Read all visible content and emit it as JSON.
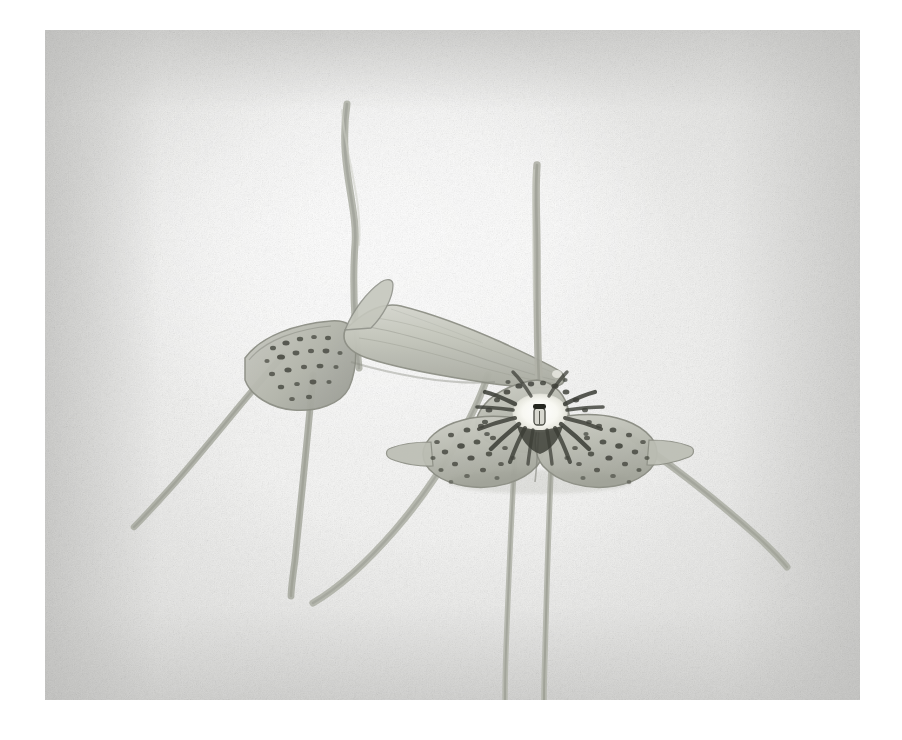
{
  "artwork": {
    "title": "Two Masdevallia Orchid Flowers",
    "medium": "Watercolor and graphite on textured paper",
    "subject": "orchid",
    "orientation": "landscape",
    "canvas": {
      "width": 902,
      "height": 740
    },
    "plate": {
      "left": 45,
      "top": 30,
      "width": 815,
      "height": 670
    },
    "background": {
      "paper_color": "#f7f7f6",
      "vignette_color": "#c8c8c6",
      "highlight_color": "#ffffff",
      "texture": "graphite-tooth"
    },
    "palette": {
      "sepal_light": "#c9cac2",
      "sepal_mid": "#b0b2a8",
      "sepal_shadow": "#9a9c92",
      "outline": "#8b8d83",
      "tail_stroke": "#a9aba1",
      "spot_dark": "#3d3f38",
      "spot_mid": "#5e6058",
      "throat_white": "#fbfbf7",
      "column_dark": "#2e302a"
    },
    "flowers": [
      {
        "id": "left-flower",
        "name": "left-orchid-flower",
        "view": "profile",
        "center": {
          "x": 330,
          "y": 355
        },
        "sepals": [
          {
            "name": "dorsal-sepal-tube",
            "spotted": false,
            "note": "pale ribbed tube pointing right"
          },
          {
            "name": "lateral-sepal-spotted",
            "spotted": true,
            "note": "spotted patch facing viewer"
          }
        ],
        "tails": [
          {
            "name": "upper-tail",
            "direction": "up",
            "tip": {
              "x": 347,
              "y": 104
            },
            "length": 255
          },
          {
            "name": "lower-left-tail",
            "direction": "down-left",
            "tip": {
              "x": 133,
              "y": 523
            },
            "length": 230
          },
          {
            "name": "lower-center-tail",
            "direction": "down",
            "tip": {
              "x": 292,
              "y": 592
            },
            "length": 240
          }
        ]
      },
      {
        "id": "right-flower",
        "name": "right-orchid-flower",
        "view": "frontal",
        "center": {
          "x": 540,
          "y": 390
        },
        "throat": {
          "name": "flower-throat",
          "color": "#fbfbf7",
          "column": {
            "name": "orchid-column",
            "color": "#2e302a"
          },
          "radiating_spots": true
        },
        "sepals": [
          {
            "name": "dorsal-sepal",
            "spotted": true,
            "position": "top"
          },
          {
            "name": "lateral-sepal-left",
            "spotted": true,
            "position": "lower-left"
          },
          {
            "name": "lateral-sepal-right",
            "spotted": true,
            "position": "lower-right"
          }
        ],
        "tails": [
          {
            "name": "dorsal-tail",
            "direction": "up",
            "tip": {
              "x": 536,
              "y": 163
            },
            "length": 225
          },
          {
            "name": "lower-left-tail",
            "direction": "down",
            "tip": {
              "x": 505,
              "y": 700
            },
            "length": 300
          },
          {
            "name": "lower-center-tail",
            "direction": "down",
            "tip": {
              "x": 545,
              "y": 700
            },
            "length": 300
          },
          {
            "name": "lower-right-tail",
            "direction": "down-right",
            "tip": {
              "x": 778,
              "y": 582
            },
            "length": 265
          }
        ]
      }
    ],
    "spot_counts": {
      "right_dorsal": 34,
      "right_lateral_left": 28,
      "right_lateral_right": 28,
      "left_lateral": 22
    }
  }
}
